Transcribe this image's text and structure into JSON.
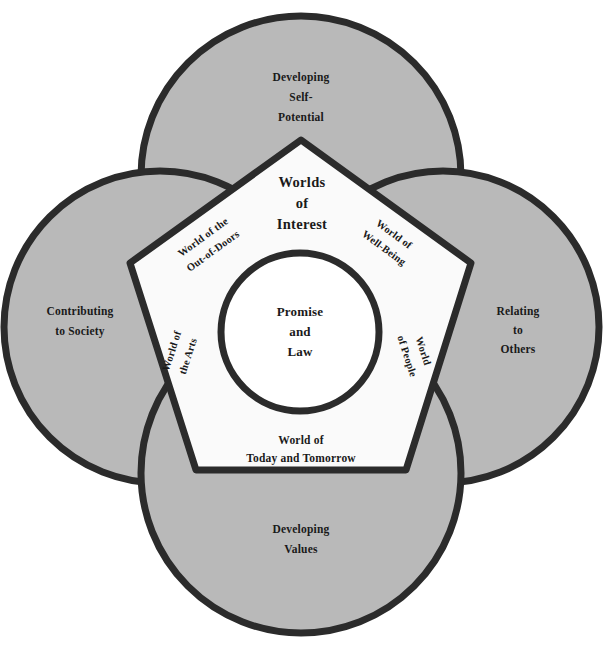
{
  "diagram": {
    "title": "Worlds of Interest",
    "type": "quatrefoil-pentagon-venn",
    "colors": {
      "lobe_fill": "#b9b9b9",
      "pentagon_fill": "#fafafa",
      "center_fill": "#ffffff",
      "stroke": "#2b2b2b",
      "page_background": "#ffffff",
      "text": "#1a1a1a"
    },
    "stroke_width": 7
  },
  "center": {
    "name": "promise-and-law",
    "lines": [
      "Promise",
      "and",
      "Law"
    ]
  },
  "heading": {
    "name": "worlds-of-interest",
    "lines": [
      "Worlds",
      "of",
      "Interest"
    ]
  },
  "lobes": [
    {
      "position": "top",
      "name": "developing-self-potential",
      "lines": [
        "Developing",
        "Self-",
        "Potential"
      ]
    },
    {
      "position": "left",
      "name": "contributing-to-society",
      "lines": [
        "Contributing",
        "to Society"
      ]
    },
    {
      "position": "right",
      "name": "relating-to-others",
      "lines": [
        "Relating",
        "to",
        "Others"
      ]
    },
    {
      "position": "bottom",
      "name": "developing-values",
      "lines": [
        "Developing",
        "Values"
      ]
    }
  ],
  "pentagon_edges": [
    {
      "position": "upper-left",
      "name": "world-of-the-out-of-doors",
      "lines": [
        "World of the",
        "Out-of-Doors"
      ],
      "rotation": -36
    },
    {
      "position": "upper-right",
      "name": "world-of-well-being",
      "lines": [
        "World of",
        "Well-Being"
      ],
      "rotation": 36
    },
    {
      "position": "left",
      "name": "world-of-the-arts",
      "lines": [
        "World of",
        "the Arts"
      ],
      "rotation": -72
    },
    {
      "position": "right",
      "name": "world-of-people",
      "lines": [
        "World",
        "of People"
      ],
      "rotation": 72
    },
    {
      "position": "bottom",
      "name": "world-of-today-and-tomorrow",
      "lines": [
        "World of",
        "Today and Tomorrow"
      ],
      "rotation": 0
    }
  ]
}
